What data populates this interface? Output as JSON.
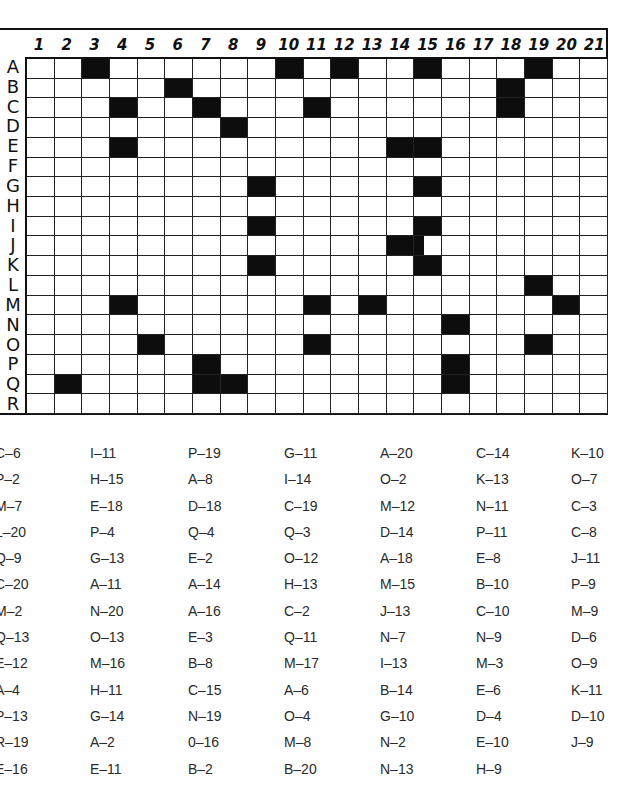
{
  "grid": {
    "columns": [
      "1",
      "2",
      "3",
      "4",
      "5",
      "6",
      "7",
      "8",
      "9",
      "10",
      "11",
      "12",
      "13",
      "14",
      "15",
      "16",
      "17",
      "18",
      "19",
      "20",
      "21"
    ],
    "rows": [
      "A",
      "B",
      "C",
      "D",
      "E",
      "F",
      "G",
      "H",
      "I",
      "J",
      "K",
      "L",
      "M",
      "N",
      "O",
      "P",
      "Q",
      "R"
    ],
    "filled_cells": [
      "A-3",
      "A-10",
      "A-12",
      "A-15",
      "A-19",
      "B-6",
      "B-18",
      "C-4",
      "C-7",
      "C-11",
      "C-18",
      "D-8",
      "E-4",
      "E-14",
      "E-15",
      "G-9",
      "G-15",
      "I-9",
      "I-15",
      "J-14",
      "K-9",
      "K-15",
      "L-19",
      "M-4",
      "M-11",
      "M-13",
      "M-20",
      "N-16",
      "O-5",
      "O-11",
      "O-19",
      "P-7",
      "P-16",
      "Q-2",
      "Q-7",
      "Q-8",
      "Q-16"
    ],
    "partial_cells": [
      "J-15"
    ],
    "colors": {
      "filled": "#0d0d0d",
      "empty": "#ffffff",
      "lines": "#222222"
    }
  },
  "coordinate_list": {
    "columns": [
      [
        "C–6",
        "P–2",
        "M–7",
        "L–20",
        "Q–9",
        "C–20",
        "M–2",
        "Q–13",
        "E–12",
        "A–4",
        "P–13",
        "R–19",
        "E–16"
      ],
      [
        "I–11",
        "H–15",
        "E–18",
        "P–4",
        "G–13",
        "A–11",
        "N–20",
        "O–13",
        "M–16",
        "H–11",
        "G–14",
        "A–2",
        "E–11"
      ],
      [
        "P–19",
        "A–8",
        "D–18",
        "Q–4",
        "E–2",
        "A–14",
        "A–16",
        "E–3",
        "B–8",
        "C–15",
        "N–19",
        "0–16",
        "B–2"
      ],
      [
        "G–11",
        "I–14",
        "C–19",
        "Q–3",
        "O–12",
        "H–13",
        "C–2",
        "Q–11",
        "M–17",
        "A–6",
        "O–4",
        "M–8",
        "B–20"
      ],
      [
        "A–20",
        "O–2",
        "M–12",
        "D–14",
        "A–18",
        "M–15",
        "J–13",
        "N–7",
        "I–13",
        "B–14",
        "G–10",
        "N–2",
        "N–13"
      ],
      [
        "C–14",
        "K–13",
        "N–11",
        "P–11",
        "E–8",
        "B–10",
        "C–10",
        "N–9",
        "M–3",
        "E–6",
        "D–4",
        "E–10",
        "H–9"
      ],
      [
        "K–10",
        "O–7",
        "C–3",
        "C–8",
        "J–11",
        "P–9",
        "M–9",
        "D–6",
        "O–9",
        "K–11",
        "D–10",
        "J–9"
      ]
    ],
    "first_column_visible_text": [
      "C–6",
      "P–2",
      "M–7",
      "–20",
      "Q–9",
      "C–20",
      "M–2",
      "Q–13",
      "E–12",
      "A–4",
      "P–13",
      "R–19",
      "E–16"
    ]
  }
}
